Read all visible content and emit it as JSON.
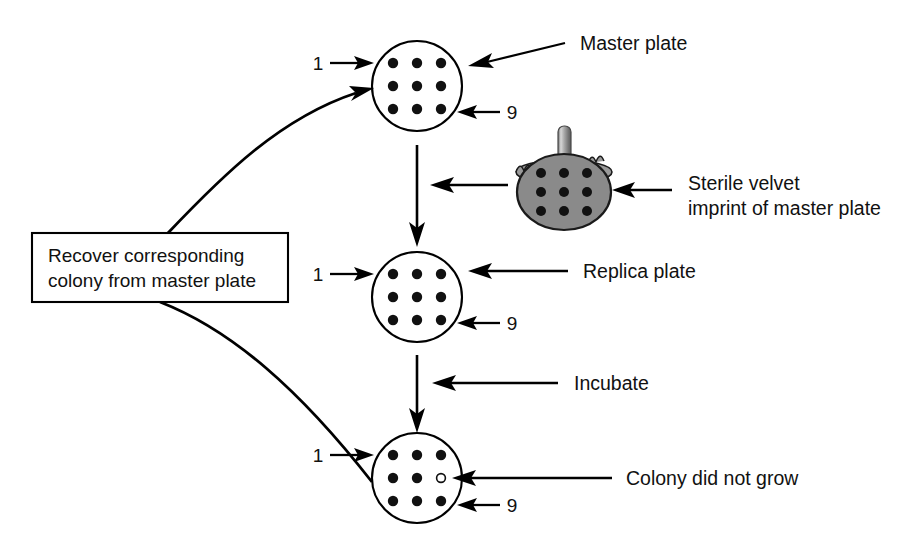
{
  "figure": {
    "background_color": "#ffffff",
    "ink_color": "#111111",
    "velvet_color": "#8a8a8a"
  },
  "plates": [
    {
      "id": "master-plate",
      "label": "Master plate",
      "first_colony_label": "1",
      "last_colony_label": "9",
      "colony_count": 9,
      "grid": "3x3",
      "colonies_grown": [
        true,
        true,
        true,
        true,
        true,
        true,
        true,
        true,
        true
      ]
    },
    {
      "id": "replica-plate",
      "label": "Replica plate",
      "first_colony_label": "1",
      "last_colony_label": "9",
      "colony_count": 9,
      "grid": "3x3",
      "colonies_grown": [
        true,
        true,
        true,
        true,
        true,
        true,
        true,
        true,
        true
      ]
    },
    {
      "id": "incubated-replica-plate",
      "label": "Colony did not grow",
      "first_colony_label": "1",
      "last_colony_label": "9",
      "colony_count": 9,
      "grid": "3x3",
      "colonies_grown": [
        true,
        true,
        true,
        true,
        true,
        false,
        true,
        true,
        true
      ],
      "missing_colony_index": 6
    }
  ],
  "annotations": {
    "velvet": {
      "line1": "Sterile velvet",
      "line2": "imprint of master plate",
      "colony_count": 9
    },
    "incubate": "Incubate",
    "recover_box": {
      "line1": "Recover corresponding",
      "line2": "colony from master plate"
    }
  }
}
